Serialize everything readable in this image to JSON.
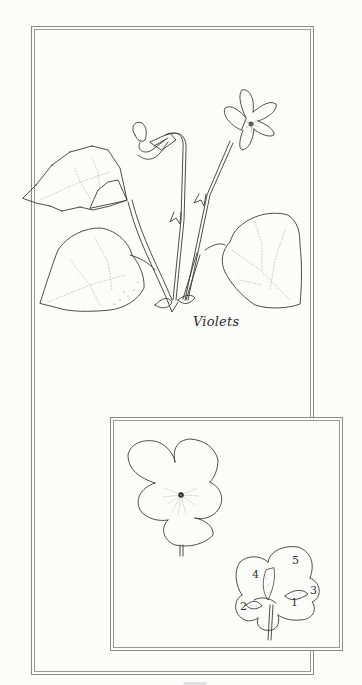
{
  "illustration": {
    "subject": "Violets",
    "caption": "Violets",
    "style": "line-art coloring page",
    "line_color": "#3a3a3a",
    "background_color": "#fcfcfb"
  },
  "main_panel": {
    "elements": [
      "nodding violet flower",
      "open violet flower",
      "heart-shaped serrated leaves",
      "stems",
      "basal leaves"
    ]
  },
  "inset_panel": {
    "elements": [
      "front view of violet flower",
      "back view of violet flower with numbered petals"
    ],
    "petal_labels": [
      "1",
      "2",
      "3",
      "4",
      "5"
    ]
  }
}
